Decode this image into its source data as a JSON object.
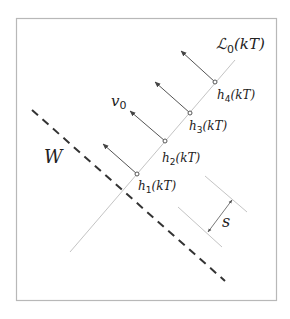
{
  "labels": {
    "curve": "ℒ",
    "curve_sub": "0",
    "curve_arg": "(kT)",
    "velocity": "v",
    "velocity_sub": "0",
    "wall": "W",
    "spacing": "s",
    "points": [
      {
        "base": "h",
        "sub": "1",
        "arg": "(kT)"
      },
      {
        "base": "h",
        "sub": "2",
        "arg": "(kT)"
      },
      {
        "base": "h",
        "sub": "3",
        "arg": "(kT)"
      },
      {
        "base": "h",
        "sub": "4",
        "arg": "(kT)"
      }
    ]
  },
  "colors": {
    "frame": "#b8b8b8",
    "line": "#c4c4c4",
    "arrow": "#555555",
    "dashed": "#333333",
    "text": "#222222"
  }
}
